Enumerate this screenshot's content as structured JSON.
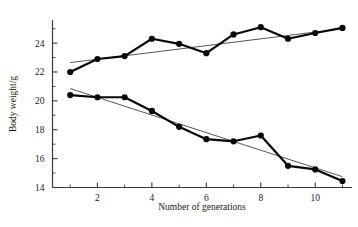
{
  "chart_data": {
    "type": "line",
    "title": "",
    "xlabel": "Number of generations",
    "ylabel": "Body weight/g",
    "x": [
      1,
      2,
      3,
      4,
      5,
      6,
      7,
      8,
      9,
      10,
      11
    ],
    "xlim": [
      0.35,
      11.35
    ],
    "ylim": [
      14,
      25.6
    ],
    "xticks": [
      2,
      4,
      6,
      8,
      10
    ],
    "xtick_labels": [
      "2",
      "4",
      "6",
      "8",
      "10"
    ],
    "xticks_minor": [
      1,
      3,
      5,
      7,
      9,
      11
    ],
    "yticks": [
      14,
      16,
      18,
      20,
      22,
      24
    ],
    "ytick_labels": [
      "14",
      "16",
      "18",
      "20",
      "22",
      "24"
    ],
    "yticks_minor": [
      15,
      17,
      19,
      21,
      23,
      25
    ],
    "grid": false,
    "legend": "none",
    "series": [
      {
        "name": "upward-selected-line",
        "marker": "filled-circle",
        "values": [
          22.0,
          22.9,
          23.1,
          24.3,
          23.95,
          23.3,
          24.6,
          25.1,
          24.3,
          24.7,
          25.05
        ],
        "trend": {
          "x": [
            1,
            11
          ],
          "y": [
            22.65,
            25.0
          ]
        }
      },
      {
        "name": "downward-selected-line",
        "marker": "filled-circle",
        "values": [
          20.4,
          20.25,
          20.25,
          19.3,
          18.2,
          17.35,
          17.2,
          17.6,
          15.5,
          15.25,
          14.45
        ],
        "trend": {
          "x": [
            1,
            11
          ],
          "y": [
            20.85,
            14.75
          ]
        }
      }
    ]
  },
  "axes": {
    "y_axis_label": "Body weight/g",
    "x_axis_label": "Number of generations"
  }
}
